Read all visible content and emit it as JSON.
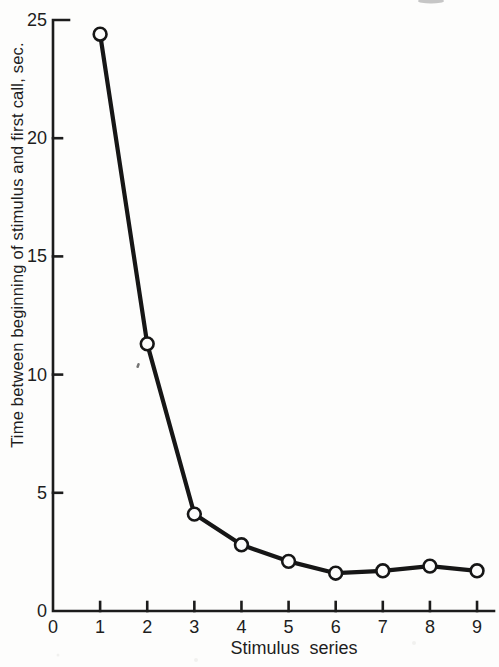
{
  "figure": {
    "background": "#fdfdfc",
    "ink_color": "#1c1c1c"
  },
  "chart_data": {
    "type": "line",
    "title": "",
    "xlabel": "Stimulus series",
    "ylabel": "Time between beginning of stimulus and first call, sec.",
    "x": [
      1,
      2,
      3,
      4,
      5,
      6,
      7,
      8,
      9
    ],
    "values": [
      24.4,
      11.3,
      4.1,
      2.8,
      2.1,
      1.6,
      1.7,
      1.9,
      1.7
    ],
    "series_name": "Latency to first call",
    "xlim": [
      0,
      9.36
    ],
    "ylim": [
      0,
      25
    ],
    "x_ticks": [
      0,
      1,
      2,
      3,
      4,
      5,
      6,
      7,
      8,
      9
    ],
    "y_ticks": [
      0,
      5,
      10,
      15,
      20,
      25
    ],
    "grid": false,
    "legend": null,
    "marker": "open-circle",
    "line_color": "#161616",
    "marker_fill": "#fdfdfc"
  }
}
